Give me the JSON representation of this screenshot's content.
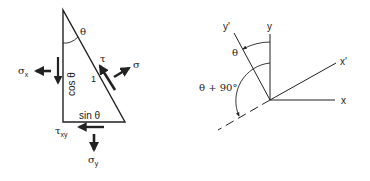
{
  "left_diagram": {
    "angle_label": "θ",
    "sigma_x_label": "σ",
    "sigma_x_sub": "x",
    "cos_label": "cos θ",
    "hyp_label": "1",
    "tau_label": "τ",
    "sigma_label": "σ",
    "sin_label": "sin θ",
    "tau_xy_label": "τ",
    "tau_xy_sub": "xy",
    "sigma_y_label": "σ",
    "sigma_y_sub": "y"
  },
  "right_diagram": {
    "y_prime_label": "y'",
    "y_label": "y",
    "x_prime_label": "x'",
    "x_label": "x",
    "theta_label": "θ",
    "theta_plus_label": "θ + 90°"
  },
  "colors": {
    "stroke": "#222222",
    "background": "#ffffff"
  }
}
